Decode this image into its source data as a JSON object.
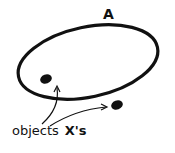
{
  "diagram": {
    "set_label": "A",
    "objects_label": "objects",
    "objects_symbol": "X's",
    "elements": [
      {
        "name": "set-A-ellipse",
        "shape": "ellipse",
        "cx": 88,
        "cy": 62,
        "rx": 72,
        "ry": 37,
        "rotate": -12
      },
      {
        "name": "object-inside",
        "shape": "dot",
        "cx": 46,
        "cy": 79
      },
      {
        "name": "object-outside",
        "shape": "dot",
        "cx": 117,
        "cy": 105
      }
    ],
    "arrows": [
      {
        "from": "objects-label",
        "to": "object-inside"
      },
      {
        "from": "objects-label",
        "to": "object-outside"
      }
    ],
    "colors": {
      "ink": "#111111",
      "background": "#ffffff"
    }
  }
}
